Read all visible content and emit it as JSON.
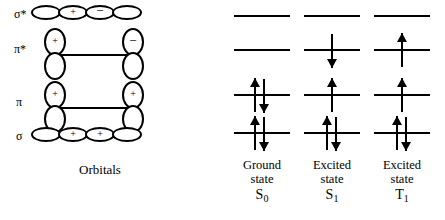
{
  "figure": {
    "type": "molecular-orbital-energy-diagram",
    "orbitals_caption": "Orbitals"
  },
  "orbital_rows": [
    {
      "key": "sigma-star",
      "label": "σ*",
      "shape": "sigma",
      "signs": [
        "",
        "+",
        "−",
        ""
      ]
    },
    {
      "key": "pi-star",
      "label": "π*",
      "shape": "pi",
      "signs": [
        "+",
        "−"
      ]
    },
    {
      "key": "pi",
      "label": "π",
      "shape": "pi",
      "signs": [
        "+",
        "+"
      ]
    },
    {
      "key": "sigma",
      "label": "σ",
      "shape": "sigma",
      "signs": [
        "",
        "+",
        "+",
        ""
      ]
    }
  ],
  "states": [
    {
      "key": "ground-state",
      "name": "Ground",
      "state_word": "state",
      "term": "S",
      "term_sub": "0",
      "levels": [
        {
          "orbital": "sigma-star",
          "electrons": []
        },
        {
          "orbital": "pi-star",
          "electrons": []
        },
        {
          "orbital": "pi",
          "electrons": [
            "up",
            "down"
          ]
        },
        {
          "orbital": "sigma",
          "electrons": [
            "up",
            "down"
          ]
        }
      ]
    },
    {
      "key": "excited-state-s1",
      "name": "Excited",
      "state_word": "state",
      "term": "S",
      "term_sub": "1",
      "levels": [
        {
          "orbital": "sigma-star",
          "electrons": []
        },
        {
          "orbital": "pi-star",
          "electrons": [
            "down"
          ]
        },
        {
          "orbital": "pi",
          "electrons": [
            "up"
          ]
        },
        {
          "orbital": "sigma",
          "electrons": [
            "up",
            "down"
          ]
        }
      ]
    },
    {
      "key": "excited-state-t1",
      "name": "Excited",
      "state_word": "state",
      "term": "T",
      "term_sub": "1",
      "levels": [
        {
          "orbital": "sigma-star",
          "electrons": []
        },
        {
          "orbital": "pi-star",
          "electrons": [
            "up"
          ]
        },
        {
          "orbital": "pi",
          "electrons": [
            "up"
          ]
        },
        {
          "orbital": "sigma",
          "electrons": [
            "up",
            "down"
          ]
        }
      ]
    }
  ],
  "colors": {
    "ink": "#000000",
    "background": "#ffffff"
  }
}
